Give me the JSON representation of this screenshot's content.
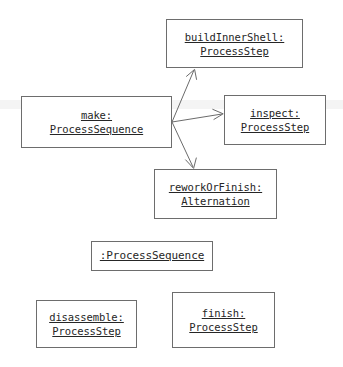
{
  "diagram": {
    "background_color": "#ffffff",
    "line_color": "#6b6b6b",
    "text_color": "#262626",
    "objects": [
      {
        "id": "buildInnerShell",
        "instance_label": "buildInnerShell:",
        "class_label": "ProcessStep",
        "x": 166,
        "y": 19,
        "w": 137,
        "h": 49
      },
      {
        "id": "make",
        "instance_label": "make:",
        "class_label": "ProcessSequence",
        "x": 21,
        "y": 96,
        "w": 151,
        "h": 52
      },
      {
        "id": "inspect",
        "instance_label": "inspect:",
        "class_label": "ProcessStep",
        "x": 224,
        "y": 95,
        "w": 102,
        "h": 50
      },
      {
        "id": "reworkOrFinish",
        "instance_label": "reworkOrFinish:",
        "class_label": "Alternation",
        "x": 154,
        "y": 169,
        "w": 123,
        "h": 50
      },
      {
        "id": "anonProcessSequence",
        "instance_label": ":ProcessSequence",
        "class_label": "",
        "x": 91,
        "y": 241,
        "w": 122,
        "h": 30
      },
      {
        "id": "disassemble",
        "instance_label": "disassemble:",
        "class_label": "ProcessStep",
        "x": 36,
        "y": 300,
        "w": 101,
        "h": 48
      },
      {
        "id": "finish",
        "instance_label": "finish:",
        "class_label": "ProcessStep",
        "x": 172,
        "y": 292,
        "w": 103,
        "h": 56
      }
    ],
    "links": [
      {
        "id": "make-to-buildInnerShell",
        "from": "make",
        "to": "buildInnerShell",
        "x1": 172,
        "y1": 122,
        "x2": 194,
        "y2": 70,
        "arrowhead": "open"
      },
      {
        "id": "make-to-inspect",
        "from": "make",
        "to": "inspect",
        "x1": 172,
        "y1": 122,
        "x2": 222,
        "y2": 114,
        "arrowhead": "open"
      },
      {
        "id": "make-to-reworkOrFinish",
        "from": "make",
        "to": "reworkOrFinish",
        "x1": 172,
        "y1": 122,
        "x2": 193,
        "y2": 167,
        "arrowhead": "open"
      }
    ]
  }
}
